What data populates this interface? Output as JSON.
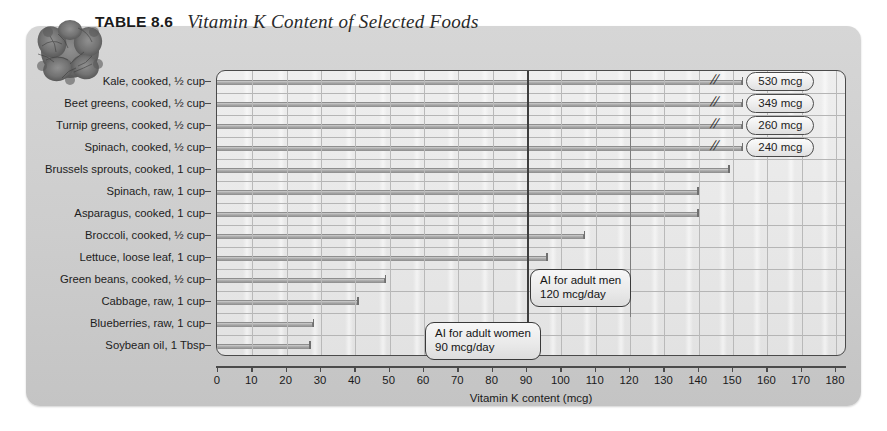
{
  "header": {
    "table_label": "TABLE 8.6",
    "title": "Vitamin K Content of Selected Foods",
    "photo_alt": "kale-photo"
  },
  "chart_data": {
    "type": "bar",
    "orientation": "horizontal",
    "title": "Vitamin K Content of Selected Foods",
    "xlabel": "Vitamin K content (mcg)",
    "ylabel": "",
    "xlim": [
      0,
      180
    ],
    "xticks": [
      0,
      10,
      20,
      30,
      40,
      50,
      60,
      70,
      80,
      90,
      100,
      110,
      120,
      130,
      140,
      150,
      160,
      170,
      180
    ],
    "grid": true,
    "legend": null,
    "categories": [
      "Kale, cooked, ½ cup",
      "Beet greens, cooked, ½ cup",
      "Turnip greens, cooked, ½ cup",
      "Spinach, cooked, ½ cup",
      "Brussels sprouts, cooked, 1 cup",
      "Spinach, raw, 1 cup",
      "Asparagus, cooked, 1 cup",
      "Broccoli, cooked, ½ cup",
      "Lettuce, loose leaf, 1 cup",
      "Green beans, cooked, ½ cup",
      "Cabbage, raw, 1 cup",
      "Blueberries, raw, 1 cup",
      "Soybean oil, 1 Tbsp"
    ],
    "values": [
      530,
      349,
      260,
      240,
      149,
      140,
      140,
      107,
      96,
      49,
      41,
      28,
      27
    ],
    "truncated_rows": [
      {
        "index": 0,
        "label": "530 mcg",
        "break_at": 153
      },
      {
        "index": 1,
        "label": "349 mcg",
        "break_at": 153
      },
      {
        "index": 2,
        "label": "260 mcg",
        "break_at": 153
      },
      {
        "index": 3,
        "label": "240 mcg",
        "break_at": 153
      }
    ],
    "reference_lines": [
      {
        "value": 90,
        "name": "ai-adult-women",
        "text_line1": "AI for adult women",
        "text_line2": "90 mcg/day",
        "color": "#3d3d3d"
      },
      {
        "value": 120,
        "name": "ai-adult-men",
        "text_line1": "AI for adult men",
        "text_line2": "120 mcg/day",
        "color": "#7d7d7d"
      }
    ]
  },
  "colors": {
    "card_background": "#d2d2d2",
    "plot_background": "#eaeaea",
    "bar_fill": "#a8a8a8",
    "axis": "#4a4a4a",
    "gridline": "#b9b9b9",
    "text": "#1a1a1a"
  }
}
